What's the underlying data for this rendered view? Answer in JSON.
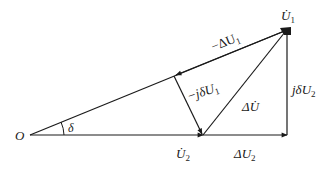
{
  "diagram": {
    "type": "phasor-diagram",
    "colors": {
      "line": "#1a1a1a",
      "background": "#ffffff"
    },
    "points": {
      "O": {
        "label": "O",
        "x": 30,
        "y": 135
      },
      "U2": {
        "label": "U̇",
        "sub": "2",
        "x": 203,
        "y": 135
      },
      "U1": {
        "label": "U̇",
        "sub": "1",
        "x": 287,
        "y": 30
      },
      "corner": {
        "x": 287,
        "y": 135
      },
      "foot": {
        "x": 175,
        "y": 75
      }
    },
    "labels": {
      "origin": "O",
      "angle": "δ",
      "u1_main": "U̇",
      "u1_sub": "1",
      "u2_main": "U̇",
      "u2_sub": "2",
      "neg_delta_u1_main": "−ΔU",
      "neg_delta_u1_sub": "1",
      "neg_j_delta_u1_main": "−jδU",
      "neg_j_delta_u1_sub": "1",
      "delta_u_dot": "ΔU̇",
      "j_delta_u2_main": "jδU",
      "j_delta_u2_sub": "2",
      "delta_u2_main": "ΔU",
      "delta_u2_sub": "2"
    },
    "vectors": [
      {
        "name": "O-to-U2",
        "from": "O",
        "to": "U2"
      },
      {
        "name": "U2-to-corner (ΔU2)",
        "from": "U2",
        "to": "corner"
      },
      {
        "name": "corner-to-U1 (jδU2)",
        "from": "corner",
        "to": "U1"
      },
      {
        "name": "O-to-U1 line",
        "from": "O",
        "to": "U1"
      },
      {
        "name": "U1-to-foot (−ΔU1)",
        "from": "U1",
        "to": "foot"
      },
      {
        "name": "foot-to-U2 (−jδU1)",
        "from": "foot",
        "to": "U2"
      },
      {
        "name": "U2-to-U1 (ΔU̇)",
        "from": "U2",
        "to": "U1"
      }
    ]
  }
}
